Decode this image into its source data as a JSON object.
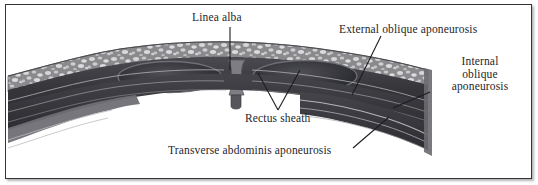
{
  "figure": {
    "kind": "anatomical-cross-section",
    "frame_color": "#33343a",
    "background_color": "#ffffff",
    "text_color": "#262629"
  },
  "labels": {
    "linea_alba": "Linea alba",
    "external_oblique": "External oblique aponeurosis",
    "internal_oblique_line1": "Internal",
    "internal_oblique_line2": "oblique",
    "internal_oblique_line3": "aponeurosis",
    "rectus_sheath": "Rectus sheath",
    "transverse_abdominis": "Transverse abdominis aponeurosis"
  },
  "structures": {
    "subcutaneous_fat": "speckled superficial fatty layer",
    "rectus_left": "left rectus abdominis muscle",
    "rectus_right": "right rectus abdominis muscle",
    "linea_alba_band": "midline fibrous raphe",
    "aponeurosis_sheets": "layered lateral aponeurotic laminae"
  },
  "palette": {
    "fat_base": "#8e8e90",
    "fat_speckle": "#d8d8da",
    "muscle_dark": "#3b3b40",
    "muscle_darker": "#2b2b30",
    "sheath_mid": "#6d6d72",
    "sheath_light": "#b9b9bd",
    "leader_line": "#1d1d20"
  }
}
